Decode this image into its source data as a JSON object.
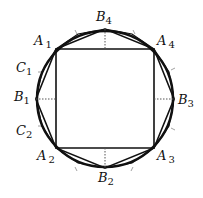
{
  "diagram": {
    "circle": {
      "cx": 105,
      "cy": 99,
      "r": 68
    },
    "square_vertices": [
      "A1",
      "A4",
      "A3",
      "A2"
    ],
    "octagon_vertices": [
      "A1",
      "B4",
      "A4",
      "B3",
      "A3",
      "B2",
      "A2",
      "B1"
    ],
    "labels": {
      "A1": {
        "main": "A",
        "sub": "1"
      },
      "A2": {
        "main": "A",
        "sub": "2"
      },
      "A3": {
        "main": "A",
        "sub": "3"
      },
      "A4": {
        "main": "A",
        "sub": "4"
      },
      "B1": {
        "main": "B",
        "sub": "1"
      },
      "B2": {
        "main": "B",
        "sub": "2"
      },
      "B3": {
        "main": "B",
        "sub": "3"
      },
      "B4": {
        "main": "B",
        "sub": "4"
      },
      "C1": {
        "main": "C",
        "sub": "1"
      },
      "C2": {
        "main": "C",
        "sub": "2"
      }
    },
    "colors": {
      "stroke": "#111111",
      "dotted": "#555555",
      "background": "#ffffff"
    }
  }
}
